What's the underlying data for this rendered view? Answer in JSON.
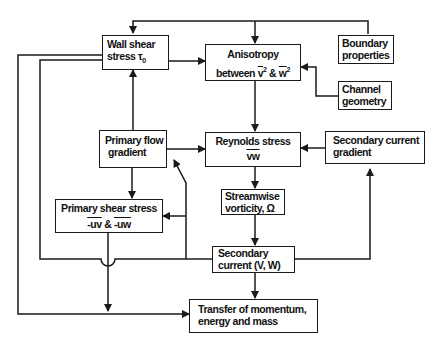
{
  "diagram": {
    "type": "flowchart",
    "nodes": {
      "wall_shear": {
        "line1": "Wall shear",
        "line2_prefix": "stress ",
        "symbol": "τ",
        "subscript": "0"
      },
      "anisotropy": {
        "line1": "Anisotropy",
        "line2_prefix": "between ",
        "v2": "v",
        "amp": " & ",
        "w2": "w",
        "sup": "2"
      },
      "boundary": {
        "line1": "Boundary",
        "line2": "properties"
      },
      "channel": {
        "line1": "Channel",
        "line2": "geometry"
      },
      "primary_flow": {
        "line1": "Primary flow",
        "line2": "gradient"
      },
      "reynolds": {
        "line1": "Reynolds stress",
        "line2": "vw"
      },
      "secondary_gradient": {
        "line1": "Secondary current",
        "line2": "gradient"
      },
      "vorticity": {
        "line1": "Streamwise",
        "line2": "vorticity, Ω"
      },
      "primary_shear": {
        "line1": "Primary shear stress",
        "uv": "-uv",
        "amp": " & ",
        "uw": "-uw"
      },
      "secondary_current": {
        "line1": "Secondary",
        "line2": "current (V, W)"
      },
      "transfer": {
        "line1": "Transfer of momentum,",
        "line2": "energy and mass"
      }
    },
    "edges": [
      {
        "from": "Boundary properties",
        "to": "Wall shear stress τ0"
      },
      {
        "from": "Boundary properties",
        "to": "Anisotropy between v² & w²"
      },
      {
        "from": "Wall shear stress τ0",
        "to": "Anisotropy between v² & w²"
      },
      {
        "from": "Channel geometry",
        "to": "Anisotropy between v² & w²"
      },
      {
        "from": "Anisotropy between v² & w²",
        "to": "Reynolds stress vw"
      },
      {
        "from": "Primary flow gradient",
        "to": "Wall shear stress τ0"
      },
      {
        "from": "Primary flow gradient",
        "to": "Reynolds stress vw"
      },
      {
        "from": "Primary flow gradient",
        "to": "Primary shear stress -uv & -uw"
      },
      {
        "from": "Secondary current gradient",
        "to": "Reynolds stress vw"
      },
      {
        "from": "Reynolds stress vw",
        "to": "Streamwise vorticity, Ω"
      },
      {
        "from": "Streamwise vorticity, Ω",
        "to": "Secondary current (V, W)"
      },
      {
        "from": "Secondary current (V, W)",
        "to": "Secondary current gradient"
      },
      {
        "from": "Secondary current (V, W)",
        "to": "Primary flow gradient"
      },
      {
        "from": "Secondary current (V, W)",
        "to": "Primary shear stress -uv & -uw"
      },
      {
        "from": "Secondary current (V, W)",
        "to": "Wall shear stress τ0"
      },
      {
        "from": "Secondary current (V, W)",
        "to": "Transfer of momentum, energy and mass"
      },
      {
        "from": "Primary shear stress -uv & -uw",
        "to": "Transfer of momentum, energy and mass"
      },
      {
        "from": "Wall shear stress τ0",
        "to": "Transfer of momentum, energy and mass"
      }
    ],
    "colors": {
      "line": "#1a1a1a",
      "background": "#ffffff"
    }
  }
}
